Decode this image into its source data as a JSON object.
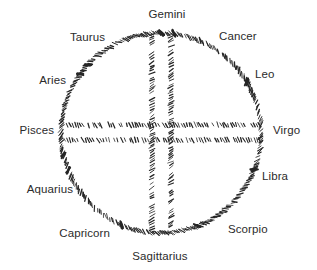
{
  "diagram": {
    "kind": "zodiac-wheel",
    "title": "",
    "stroke_color": "#262626",
    "text_color": "#2b2b2b",
    "background_color": "#ffffff",
    "circle": {
      "cx": 161,
      "cy": 133,
      "r": 100
    },
    "cross": {
      "vertical_lines_x": [
        152,
        171
      ],
      "horizontal_lines_y": [
        125,
        140
      ]
    },
    "labels": [
      {
        "key": "gemini",
        "text": "Gemini",
        "x": 167,
        "y": 14,
        "anchor": "mid"
      },
      {
        "key": "cancer",
        "text": "Cancer",
        "x": 219,
        "y": 36,
        "anchor": "start"
      },
      {
        "key": "leo",
        "text": "Leo",
        "x": 255,
        "y": 74,
        "anchor": "start"
      },
      {
        "key": "virgo",
        "text": "Virgo",
        "x": 273,
        "y": 130,
        "anchor": "start"
      },
      {
        "key": "libra",
        "text": "Libra",
        "x": 262,
        "y": 176,
        "anchor": "start"
      },
      {
        "key": "scorpio",
        "text": "Scorpio",
        "x": 228,
        "y": 229,
        "anchor": "start"
      },
      {
        "key": "sagittarius",
        "text": "Sagittarius",
        "x": 160,
        "y": 256,
        "anchor": "mid"
      },
      {
        "key": "capricorn",
        "text": "Capricorn",
        "x": 110,
        "y": 233,
        "anchor": "end"
      },
      {
        "key": "aquarius",
        "text": "Aquarius",
        "x": 73,
        "y": 189,
        "anchor": "end"
      },
      {
        "key": "pisces",
        "text": "Pisces",
        "x": 54,
        "y": 130,
        "anchor": "end"
      },
      {
        "key": "aries",
        "text": "Aries",
        "x": 66,
        "y": 80,
        "anchor": "end"
      },
      {
        "key": "taurus",
        "text": "Taurus",
        "x": 105,
        "y": 37,
        "anchor": "end"
      }
    ]
  }
}
